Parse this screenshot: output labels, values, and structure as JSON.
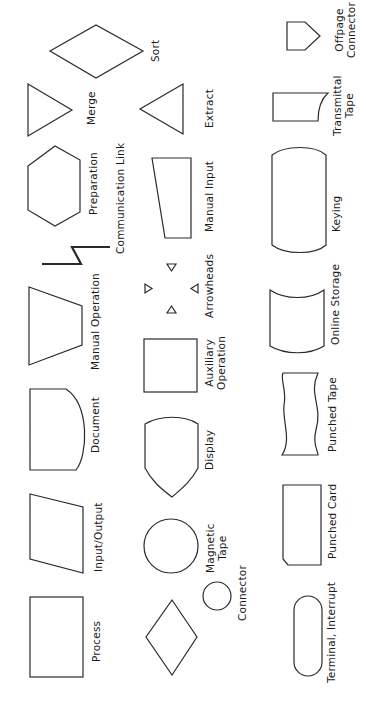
{
  "diagram": {
    "orientation": "rotated 90 degrees counter-clockwise",
    "symbols": [
      {
        "name": "Process",
        "label": "Process"
      },
      {
        "name": "Input/Output",
        "label": "Input/Output"
      },
      {
        "name": "Document",
        "label": "Document"
      },
      {
        "name": "Manual Operation",
        "label": "Manual Operation"
      },
      {
        "name": "Preparation",
        "label": "Preparation"
      },
      {
        "name": "Merge",
        "label": "Merge"
      },
      {
        "name": "Sort",
        "label": "Sort"
      },
      {
        "name": "Decision",
        "label": ""
      },
      {
        "name": "Connector",
        "label": "Connector"
      },
      {
        "name": "Magnetic Tape",
        "label_line1": "Magnetic",
        "label_line2": "Tape"
      },
      {
        "name": "Display",
        "label": "Display"
      },
      {
        "name": "Auxiliary Operation",
        "label_line1": "Auxiliary",
        "label_line2": "Operation"
      },
      {
        "name": "Arrowheads",
        "label": "Arrowheads"
      },
      {
        "name": "Communication Link",
        "label": "Communication Link"
      },
      {
        "name": "Manual Input",
        "label": "Manual Input"
      },
      {
        "name": "Extract",
        "label": "Extract"
      },
      {
        "name": "Terminal, Interrupt",
        "label": "Terminal, Interrupt"
      },
      {
        "name": "Punched Card",
        "label": "Punched Card"
      },
      {
        "name": "Punched Tape",
        "label": "Punched Tape"
      },
      {
        "name": "Online Storage",
        "label": "Online Storage"
      },
      {
        "name": "Keying",
        "label": "Keying"
      },
      {
        "name": "Transmittal Tape",
        "label_line1": "Transmittal",
        "label_line2": "Tape"
      },
      {
        "name": "Offpage Connector",
        "label_line1": "Offpage",
        "label_line2": "Connector"
      }
    ]
  }
}
